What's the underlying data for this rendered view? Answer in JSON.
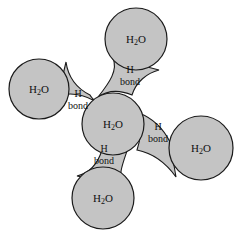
{
  "figure": {
    "background_color": "#ffffff",
    "molecule_fill": "#c4c4c4",
    "bond_fill": "#c4c4c4",
    "stroke_color": "#1a1a1a"
  },
  "molecules": [
    {
      "id": "center",
      "label_main1": "H",
      "label_sub": "2",
      "label_main2": "O",
      "position": "center",
      "cx": 113,
      "cy": 124,
      "r": 31
    },
    {
      "id": "top",
      "label_main1": "H",
      "label_sub": "2",
      "label_main2": "O",
      "position": "top",
      "cx": 136,
      "cy": 39,
      "r": 31
    },
    {
      "id": "left",
      "label_main1": "H",
      "label_sub": "2",
      "label_main2": "O",
      "position": "left",
      "cx": 39,
      "cy": 89,
      "r": 30
    },
    {
      "id": "right",
      "label_main1": "H",
      "label_sub": "2",
      "label_main2": "O",
      "position": "right",
      "cx": 201,
      "cy": 148,
      "r": 32
    },
    {
      "id": "bottom",
      "label_main1": "H",
      "label_sub": "2",
      "label_main2": "O",
      "position": "bottom",
      "cx": 103,
      "cy": 198,
      "r": 31
    }
  ],
  "bonds": [
    {
      "id": "bond-top",
      "line1": "H",
      "line2": "bond",
      "connects": [
        "center",
        "top"
      ],
      "label_x": 130,
      "label_y1": 73,
      "label_y2": 85
    },
    {
      "id": "bond-left",
      "line1": "H",
      "line2": "bond",
      "connects": [
        "center",
        "left"
      ],
      "label_x": 78,
      "label_y1": 97,
      "label_y2": 109
    },
    {
      "id": "bond-right",
      "line1": "H",
      "line2": "bond",
      "connects": [
        "center",
        "right"
      ],
      "label_x": 158,
      "label_y1": 130,
      "label_y2": 142
    },
    {
      "id": "bond-bottom",
      "line1": "H",
      "line2": "bond",
      "connects": [
        "center",
        "bottom"
      ],
      "label_x": 104,
      "label_y1": 152,
      "label_y2": 164
    }
  ]
}
